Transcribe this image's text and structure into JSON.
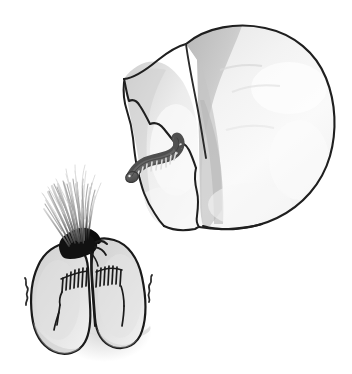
{
  "artwork": {
    "title": "Hand-drawn grayscale illustration",
    "description": "A bitten apple with a worm emerging beside a pair of smoking lungs",
    "background_color": "#ffffff",
    "ink_color": "#1a1a1a",
    "style": "hand-drawn pencil sketch, grayscale"
  },
  "objects": {
    "apple": {
      "name": "bitten-apple",
      "label": "Apple with a bite taken out",
      "position": "upper-right",
      "body_fill": "#f2f2f2",
      "shade_fill": "#c9c9c9",
      "highlight_fill": "#fbfbfb",
      "outline_color": "#1f1f1f",
      "outline_width": 2,
      "bite_edge": "jagged-wavy",
      "lobes": 2
    },
    "worm": {
      "name": "worm",
      "label": "Segmented worm emerging from the apple",
      "position": "center-left of apple bite",
      "body_fill": "#595959",
      "segment_band_fill": "#d8d8d8",
      "outline_color": "#3a3a3a",
      "segments": 11,
      "shape": "arched S-curve"
    },
    "lungs": {
      "name": "smoking-lungs",
      "label": "Pair of lungs with burning, charred top and rising smoke",
      "position": "lower-left",
      "body_fill": "#d4d4d4",
      "outline_color": "#1a1a1a",
      "outline_width": 2.2,
      "shadow_fill": "#d9d9d9",
      "lobes": 2,
      "bronchi_hatch_count": 14,
      "char_fill": "#111111",
      "smoke_color_top": "#cfcfcf",
      "smoke_color_base": "#1a1a1a",
      "smoke_strands": 46,
      "smoke_direction": "up-left"
    },
    "pain_marks": {
      "name": "pain-squiggles",
      "label": "Small squiggle marks indicating distress",
      "color": "#2a2a2a",
      "count": 2,
      "sides": [
        "left",
        "right"
      ]
    }
  }
}
